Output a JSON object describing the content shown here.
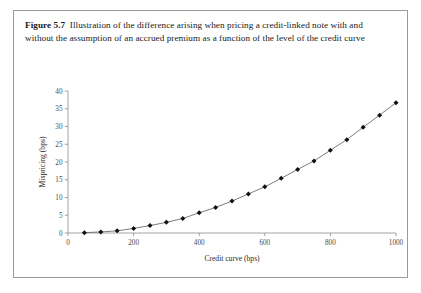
{
  "figure": {
    "number_label": "Figure 5.7",
    "caption": "Illustration of the difference arising when pricing a credit-linked note with and without the assumption of an accrued premium as a function of the level of the credit curve"
  },
  "chart_data": {
    "type": "line",
    "title": "",
    "subtitle": "",
    "xlabel": "Credit curve (bps)",
    "ylabel": "Mispricing (bps)",
    "xlim": [
      0,
      1000
    ],
    "ylim": [
      0,
      40
    ],
    "xticks": [
      0,
      200,
      400,
      600,
      800,
      1000
    ],
    "xtick_labels": [
      "0",
      "200",
      "400",
      "600",
      "800",
      "1000"
    ],
    "yticks": [
      0,
      5,
      10,
      15,
      20,
      25,
      30,
      35,
      40
    ],
    "ytick_labels": [
      "0",
      "5",
      "10",
      "15",
      "20",
      "25",
      "30",
      "35",
      "40"
    ],
    "grid": false,
    "legend": false,
    "legend_position": "none",
    "marker": "diamond",
    "x": [
      50,
      100,
      150,
      200,
      250,
      300,
      350,
      400,
      450,
      500,
      550,
      600,
      650,
      700,
      750,
      800,
      850,
      900,
      950,
      1000
    ],
    "series": [
      {
        "name": "Mispricing",
        "color": "#111111",
        "values": [
          0.1,
          0.3,
          0.6,
          1.3,
          2.1,
          3.0,
          4.1,
          5.7,
          7.2,
          9.0,
          11.0,
          13.0,
          15.4,
          17.9,
          20.3,
          23.3,
          26.3,
          29.8,
          33.2,
          36.7
        ]
      }
    ]
  },
  "colors": {
    "border": "#9a9a9a",
    "axis": "#8d8d8d",
    "marker": "#111111",
    "line": "#5a5a5a",
    "text": "#1a1a1a"
  }
}
